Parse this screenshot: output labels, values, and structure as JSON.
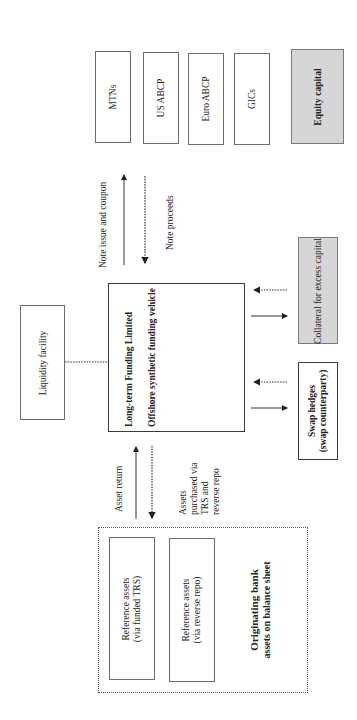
{
  "diagram": {
    "orientation": "rotated -90deg (text reads bottom-to-top)",
    "funding_instruments": [
      {
        "label": "MTNs"
      },
      {
        "label": "US ABCP"
      },
      {
        "label": "Euro ABCP"
      },
      {
        "label": "GICs"
      }
    ],
    "equity": {
      "label": "Equity capital"
    },
    "note_flows": {
      "issue": "Note issue and coupon",
      "proceeds": "Note proceeds"
    },
    "liquidity": {
      "label": "Liquidity facility"
    },
    "vehicle": {
      "title": "Long-term Funding Limited",
      "subtitle": "Offshore synthetic funding vehicle"
    },
    "collateral": {
      "label": "Collateral for excess capital"
    },
    "swap": {
      "line1": "Swap hedges",
      "line2": "(swap counterparty)"
    },
    "asset_flows": {
      "return": "Asset return",
      "purchase_line1": "Assets",
      "purchase_line2": "purchased via",
      "purchase_line3": "TRS and",
      "purchase_line4": "reverse repo"
    },
    "bank": {
      "line1": "Originating bank",
      "line2": "assets on balance sheet",
      "ref_assets": [
        {
          "line1": "Reference assets",
          "line2": "(via funded TRS)"
        },
        {
          "line1": "Reference assets",
          "line2": "(via reverse repo)"
        }
      ]
    },
    "colors": {
      "line": "#333333",
      "box_border": "#6e6e6e",
      "gray_fill": "#d6d6d6"
    }
  }
}
